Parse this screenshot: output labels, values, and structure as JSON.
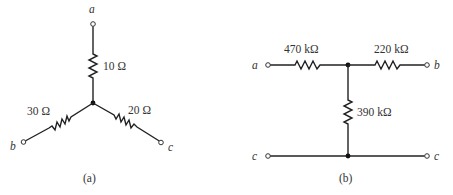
{
  "figure_a": {
    "caption": "(a)",
    "type": "Y (wye) network",
    "terminals": {
      "a": "a",
      "b": "b",
      "c": "c"
    },
    "resistors": {
      "ra": {
        "label": "10 Ω",
        "value_ohms": 10,
        "between": [
          "a",
          "center"
        ]
      },
      "rb": {
        "label": "30 Ω",
        "value_ohms": 30,
        "between": [
          "b",
          "center"
        ]
      },
      "rc": {
        "label": "20 Ω",
        "value_ohms": 20,
        "between": [
          "c",
          "center"
        ]
      }
    }
  },
  "figure_b": {
    "caption": "(b)",
    "type": "T network",
    "terminals": {
      "a": "a",
      "b": "b",
      "c_left": "c",
      "c_right": "c"
    },
    "resistors": {
      "r1": {
        "label": "470 kΩ",
        "value_ohms": 470000,
        "between": [
          "a",
          "node"
        ]
      },
      "r2": {
        "label": "220 kΩ",
        "value_ohms": 220000,
        "between": [
          "node",
          "b"
        ]
      },
      "r3": {
        "label": "390 kΩ",
        "value_ohms": 390000,
        "between": [
          "node",
          "c"
        ]
      }
    }
  }
}
